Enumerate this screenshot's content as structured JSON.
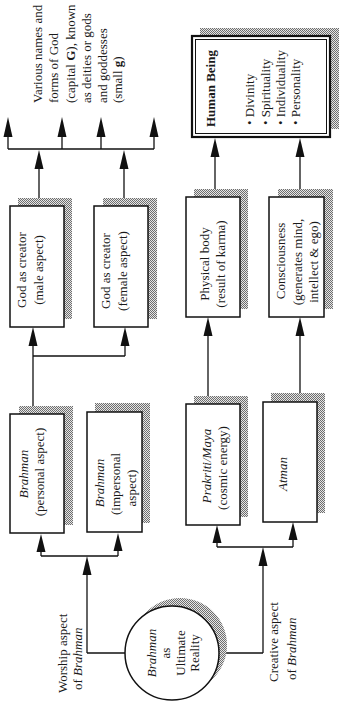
{
  "diagram": {
    "top_label": {
      "line1": "Various names and",
      "line2": "forms of God",
      "line3_pre": "(capital ",
      "line3_bold": "G",
      "line3_post": "), known",
      "line4": "as deities or gods",
      "line5": "and goddesses",
      "line6_pre": "(small ",
      "line6_bold": "g",
      "line6_post": ")"
    },
    "nodes": {
      "ultimate_reality": {
        "line1": "Brahman",
        "line2": "as",
        "line3": "Ultimate",
        "line4": "Reality"
      },
      "brahman_personal": {
        "line1": "Brahman",
        "line2": "(personal aspect)"
      },
      "brahman_impersonal": {
        "line1": "Brahman",
        "line2": "(impersonal",
        "line3": "aspect)"
      },
      "god_male": {
        "line1": "God as creator",
        "line2": "(male aspect)"
      },
      "god_female": {
        "line1": "God as creator",
        "line2": "(female aspect)"
      },
      "prakriti_maya": {
        "line1": "Prakriti/Maya",
        "line2": "(cosmic energy)"
      },
      "atman": {
        "line1": "Atman"
      },
      "physical_body": {
        "line1": "Physical body",
        "line2": "(result of karma)"
      },
      "consciousness": {
        "line1": "Consciousness",
        "line2": "(generates mind,",
        "line3": "intellect & ego)"
      },
      "human_being": {
        "title": "Human Being",
        "bullets": [
          "• Divinity",
          "• Spirituality",
          "• Individuality",
          "• Personality"
        ]
      }
    },
    "edge_labels": {
      "worship": {
        "line1": "Worship aspect",
        "line2_pre": "of ",
        "line2_italic": "Brahman"
      },
      "creative": {
        "line1": "Creative aspect",
        "line2_pre": "of ",
        "line2_italic": "Brahman"
      }
    },
    "colors": {
      "line": "#111111",
      "shadow_dark": "#6e6e6e",
      "shadow_light": "#e6e6e6",
      "background": "#ffffff"
    }
  }
}
